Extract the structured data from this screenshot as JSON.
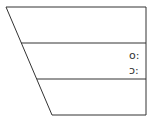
{
  "diagram": {
    "shape": "trapezoid-chart-with-rows",
    "stroke_color": "#333333",
    "background": "#ffffff",
    "rows": [
      {
        "label": ""
      },
      {
        "labels": [
          "o:",
          "ɔ:"
        ]
      },
      {
        "label": ""
      }
    ]
  }
}
